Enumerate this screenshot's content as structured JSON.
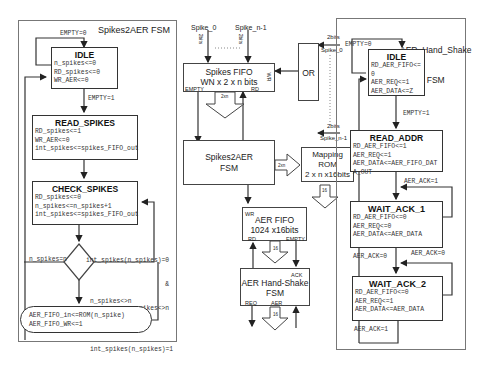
{
  "left_fsm": {
    "title": "Spikes2AER FSM",
    "states": [
      {
        "name": "IDLE",
        "actions": [
          "n_spikes<=0",
          "RD_spikes<=0",
          "WR_AER<=0"
        ]
      },
      {
        "name": "READ_SPIKES",
        "actions": [
          "RD_spikes<=1",
          "WR_AER<=0",
          "int_spikes<=spikes_FIFO_out"
        ]
      },
      {
        "name": "CHECK_SPIKES",
        "actions": [
          "RD_spikes<=0",
          "n_spikes<=n_spikes+1",
          "int_spikes<=spikes_FIFO_out"
        ]
      }
    ],
    "output_state": {
      "actions": [
        "AER_FIFO_in<=ROM(n_spike)",
        "AER_FIFO_WR<=1"
      ]
    },
    "transitions": {
      "idle_loop": "EMPTY=0",
      "idle_to_read": "EMPTY=1",
      "decision_left": "n_spikes=n",
      "decision_right": [
        "int_spikes(n_spikes)=0",
        "&",
        "n_spikes<>n"
      ],
      "decision_down": [
        "n_spikes<>n",
        "&",
        "int_spikes(n_spikes)=1"
      ]
    }
  },
  "middle_block": {
    "inputs": {
      "spike_0": "Spike_0",
      "spike_n1": "Spike_n-1",
      "dots": "........",
      "width_label": "2bits"
    },
    "or_inputs": [
      {
        "width": "2bits",
        "name": "Spike_0"
      },
      {
        "width": "2bits",
        "name": "Spike_n-1"
      }
    ],
    "or_label": "OR",
    "spikes_fifo": {
      "title": "Spikes FIFO",
      "size": "WN x 2 x n bits",
      "ports": {
        "empty": "EMPTY",
        "rd": "RD",
        "wr": "WR"
      }
    },
    "bus_2xn": "2xn",
    "spikes2aer": {
      "line1": "Spikes2AER",
      "line2": "FSM"
    },
    "mapping_rom": {
      "line1": "Mapping",
      "line2": "ROM",
      "line3": "2 x n x16bits"
    },
    "bus_16": "16",
    "aer_fifo": {
      "title": "AER FIFO",
      "size": "1024 x16bits",
      "ports": {
        "wr": "WR",
        "rd": "RD",
        "empty": "EMPTY"
      }
    },
    "aer_handshake": {
      "line1": "AER Hand-Shake",
      "line2": "FSM",
      "ports": {
        "ack": "ACK",
        "req": "REQ",
        "aer": "AER"
      }
    }
  },
  "right_fsm": {
    "title_line1": "AER_Hand_Shake",
    "title_line2": "FSM",
    "states": [
      {
        "name": "IDLE",
        "actions": [
          "RD_AER_FIFO<=",
          "0",
          "AER_REQ<=1",
          "AER_DATA<=Z"
        ]
      },
      {
        "name": "READ_ADDR",
        "actions": [
          "RD_AER_FIFO<=1",
          "AER_REQ<=1",
          "AER_DATA<=AER_FIFO_DAT",
          "A_OUT"
        ]
      },
      {
        "name": "WAIT_ACK_1",
        "actions": [
          "RD_AER_FIFO<=0",
          "AER_REQ<=0",
          "AER_DATA<=AER_DATA"
        ]
      },
      {
        "name": "WAIT_ACK_2",
        "actions": [
          "RD_AER_FIFO<=0",
          "AER_REQ<=1",
          "AER_DATA<=AER_DATA"
        ]
      }
    ],
    "transitions": {
      "idle_loop": "EMPTY=0",
      "idle_to_read": "EMPTY=1",
      "wait1_loop": "AER_ACK=1",
      "wait1_to_wait2": "AER_ACK=0",
      "wait2_loop": "AER_ACK=0",
      "wait2_exit": "AER_ACK=1"
    }
  }
}
